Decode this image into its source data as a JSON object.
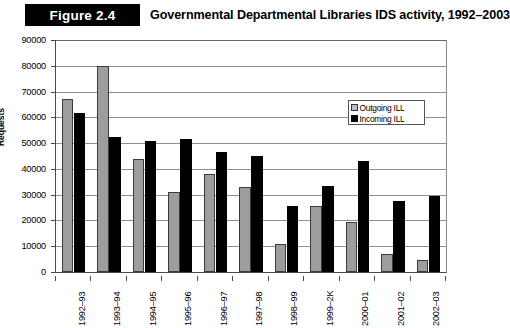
{
  "figure": {
    "badge": "Figure 2.4",
    "title": "Governmental Departmental Libraries IDS activity, 1992–2003"
  },
  "legend": {
    "position": "inside-top-right",
    "items": [
      {
        "label": "Outgoing ILL",
        "color": "#bdbdbd"
      },
      {
        "label": "Incoming ILL",
        "color": "#000000"
      }
    ]
  },
  "chart_data": {
    "type": "bar",
    "title": "Governmental Departmental Libraries IDS activity, 1992–2003",
    "xlabel": "",
    "ylabel": "Requests",
    "ylim": [
      0,
      90000
    ],
    "ytick_step": 10000,
    "yticks": [
      "0",
      "10000",
      "20000",
      "30000",
      "40000",
      "50000",
      "60000",
      "70000",
      "80000",
      "90000"
    ],
    "grid": true,
    "grid_axis": "y",
    "legend_position": "upper right inside plot",
    "categories": [
      "1992–93",
      "1993–94",
      "1994–95",
      "1995–96",
      "1996–97",
      "1997–98",
      "1998–99",
      "1999–2K",
      "2000–01",
      "2001–02",
      "2002–03"
    ],
    "series": [
      {
        "name": "Outgoing ILL",
        "color": "#9d9d9d",
        "values": [
          67000,
          80000,
          44000,
          31000,
          38000,
          33000,
          11000,
          25500,
          19500,
          6800,
          4500
        ]
      },
      {
        "name": "Incoming ILL",
        "color": "#000000",
        "values": [
          61500,
          52500,
          51000,
          51500,
          46500,
          45000,
          25500,
          33500,
          43000,
          27500,
          29500
        ]
      }
    ]
  }
}
